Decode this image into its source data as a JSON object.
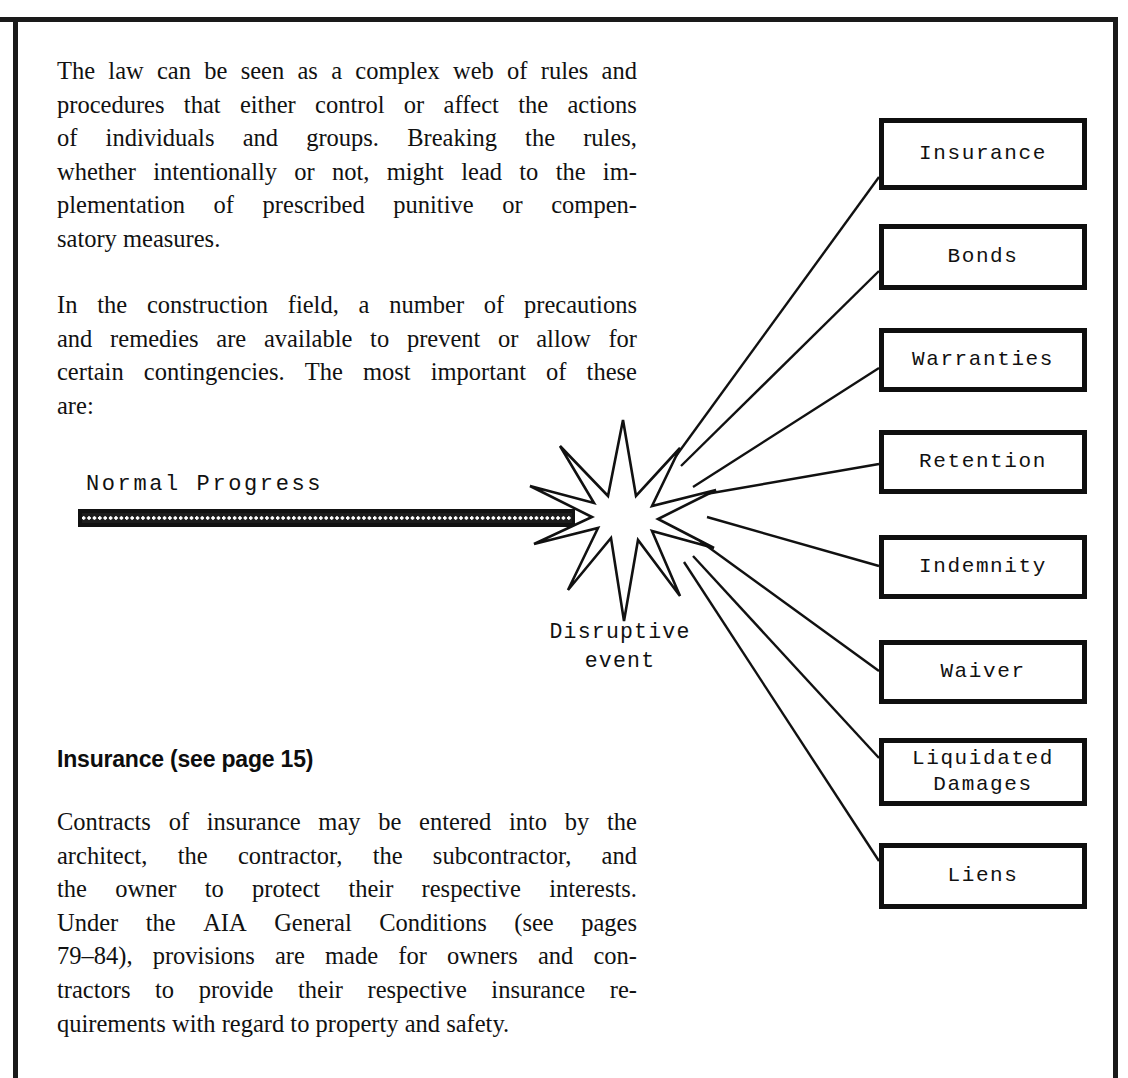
{
  "page": {
    "background": "#ffffff",
    "ink": "#111111"
  },
  "body_text": {
    "paragraph_1": [
      "The law can be seen as a complex web of rules and",
      "procedures that either control or affect the actions",
      "of individuals and groups. Breaking the rules,",
      "whether intentionally or not, might lead to the im-",
      "plementation of prescribed punitive or compen-",
      "satory measures."
    ],
    "paragraph_2": [
      "In the construction field, a number of precautions",
      "and remedies are available to prevent or allow for",
      "certain contingencies. The most important of these",
      "are:"
    ],
    "paragraph_3": [
      "Contracts of insurance may be entered into by the",
      "architect, the contractor, the subcontractor, and",
      "the owner to protect their respective interests.",
      "Under the AIA General Conditions (see pages",
      "79–84), provisions are made for owners and con-",
      "tractors to provide their respective insurance re-",
      "quirements with regard to property and safety."
    ]
  },
  "heading": {
    "text": "Insurance (see page 15)"
  },
  "diagram": {
    "progress_label": "Normal Progress",
    "star_caption_line1": "Disruptive",
    "star_caption_line2": "event",
    "boxes": [
      {
        "label": "Insurance",
        "label2": ""
      },
      {
        "label": "Bonds",
        "label2": ""
      },
      {
        "label": "Warranties",
        "label2": ""
      },
      {
        "label": "Retention",
        "label2": ""
      },
      {
        "label": "Indemnity",
        "label2": ""
      },
      {
        "label": "Waiver",
        "label2": ""
      },
      {
        "label": "Liquidated",
        "label2": "Damages"
      },
      {
        "label": "Liens",
        "label2": ""
      }
    ]
  }
}
